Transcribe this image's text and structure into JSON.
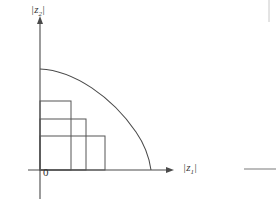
{
  "figure": {
    "kind": "math-diagram",
    "background_color": "#ffffff",
    "line_color": "#4a4a4a",
    "curve_color": "#4a4a4a",
    "rect_color": "#555555",
    "axes": {
      "x": {
        "label_parts": {
          "open_bar": "|",
          "symbol": "z",
          "subscript": "1",
          "close_bar": "|"
        },
        "label_text": "|z1|",
        "arrow": "arrow-right",
        "start_x": 28,
        "end_x": 172,
        "y": 170
      },
      "y": {
        "label_parts": {
          "open_bar": "|",
          "symbol": "z",
          "subscript": "2",
          "close_bar": "|"
        },
        "label_text": "|z2|",
        "arrow": "arrow-up",
        "x": 40,
        "top_y": 18,
        "bottom_y": 199
      },
      "origin_label": "0"
    },
    "curve": {
      "type": "concave-decreasing",
      "y_intercept": {
        "x": 40,
        "y": 69
      },
      "x_intercept": {
        "x": 151,
        "y": 170
      },
      "path": "M 40 69 C 72 71 110 96 135 130 C 144 142 149 158 151 170"
    },
    "staircase_rects": [
      {
        "name": "rect-tall-narrow",
        "x": 40,
        "y": 101,
        "width": 31,
        "height": 69
      },
      {
        "name": "rect-medium",
        "x": 40,
        "y": 119,
        "width": 46,
        "height": 51
      },
      {
        "name": "rect-short-wide",
        "x": 40,
        "y": 136,
        "width": 65,
        "height": 34
      }
    ],
    "edge_artifacts": [
      {
        "name": "crop-artifact-vertical-right",
        "x": 269,
        "y1": 0,
        "y2": 22
      },
      {
        "name": "crop-artifact-horizontal-right",
        "y": 169,
        "x1": 244,
        "x2": 276
      }
    ]
  }
}
